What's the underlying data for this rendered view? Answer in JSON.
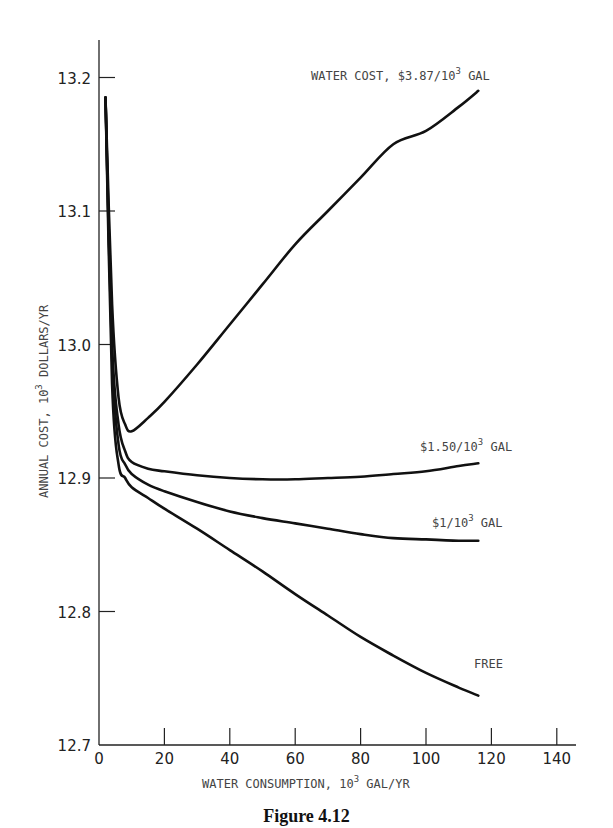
{
  "figure": {
    "caption": "Figure 4.12"
  },
  "chart_data": {
    "type": "line",
    "title": "",
    "xlabel": "WATER CONSUMPTION, 10^3 GAL/YR",
    "ylabel": "ANNUAL COST, 10^3 DOLLARS/YR",
    "xlim": [
      0,
      150
    ],
    "ylim": [
      12.7,
      13.23
    ],
    "x_ticks": [
      0,
      20,
      40,
      60,
      80,
      100,
      120,
      140
    ],
    "y_ticks": [
      12.7,
      12.8,
      12.9,
      13.0,
      13.1,
      13.2
    ],
    "grid": false,
    "legend_position": "inline labels at curve ends",
    "series": [
      {
        "name": "WATER COST, $3.87/10^3 GAL",
        "label_text": "WATER COST, $3.87/10",
        "label_sup": "3",
        "label_suffix": " GAL",
        "x": [
          2,
          4,
          6,
          8,
          10,
          15,
          20,
          30,
          40,
          50,
          60,
          70,
          80,
          90,
          100,
          110,
          116
        ],
        "y": [
          13.185,
          13.03,
          12.96,
          12.94,
          12.935,
          12.945,
          12.957,
          12.985,
          13.015,
          13.045,
          13.075,
          13.1,
          13.125,
          13.15,
          13.16,
          13.178,
          13.19
        ]
      },
      {
        "name": "$1.50/10^3 GAL",
        "label_text": "$1.50/10",
        "label_sup": "3",
        "label_suffix": " GAL",
        "x": [
          2,
          4,
          6,
          8,
          10,
          15,
          20,
          30,
          40,
          50,
          60,
          70,
          80,
          90,
          100,
          110,
          116
        ],
        "y": [
          13.185,
          13.0,
          12.94,
          12.92,
          12.912,
          12.907,
          12.905,
          12.902,
          12.9,
          12.899,
          12.899,
          12.9,
          12.901,
          12.903,
          12.905,
          12.909,
          12.911
        ]
      },
      {
        "name": "$1/10^3 GAL",
        "label_text": "$1/10",
        "label_sup": "3",
        "label_suffix": " GAL",
        "x": [
          2,
          4,
          6,
          8,
          10,
          15,
          20,
          30,
          40,
          50,
          60,
          70,
          80,
          90,
          100,
          110,
          116
        ],
        "y": [
          13.185,
          12.99,
          12.925,
          12.91,
          12.903,
          12.895,
          12.89,
          12.882,
          12.875,
          12.87,
          12.866,
          12.862,
          12.858,
          12.855,
          12.854,
          12.853,
          12.853
        ]
      },
      {
        "name": "FREE",
        "label_text": "FREE",
        "label_sup": "",
        "label_suffix": "",
        "x": [
          2,
          4,
          6,
          8,
          10,
          15,
          20,
          30,
          40,
          50,
          60,
          70,
          80,
          90,
          100,
          110,
          116
        ],
        "y": [
          13.185,
          12.97,
          12.91,
          12.9,
          12.893,
          12.885,
          12.877,
          12.862,
          12.846,
          12.83,
          12.813,
          12.797,
          12.781,
          12.767,
          12.754,
          12.743,
          12.737
        ]
      }
    ]
  },
  "labels": {
    "x_axis": {
      "text": "WATER CONSUMPTION, 10",
      "sup": "3",
      "suffix": " GAL/YR"
    },
    "y_axis": {
      "text": "ANNUAL COST, 10",
      "sup": "3",
      "suffix": " DOLLARS/YR"
    },
    "x_tick_labels": [
      "0",
      "20",
      "40",
      "60",
      "80",
      "100",
      "120",
      "140"
    ],
    "y_tick_labels": [
      "12.7",
      "12.8",
      "12.9",
      "13.0",
      "13.1",
      "13.2"
    ]
  }
}
